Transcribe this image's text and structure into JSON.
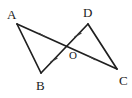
{
  "figure": {
    "background_color": "#ffffff",
    "line_color": "#1f1f1f",
    "tick_color": "#3a3a3a",
    "label_color": "#1a1a1a",
    "width": 132,
    "height": 98,
    "labels": {
      "a": "A",
      "b": "B",
      "c": "C",
      "d": "D",
      "o": "O"
    },
    "points": {
      "A": {
        "x": 17,
        "y": 24
      },
      "B": {
        "x": 41,
        "y": 73
      },
      "C": {
        "x": 117,
        "y": 69
      },
      "D": {
        "x": 88,
        "y": 24
      },
      "O": {
        "x": 67,
        "y": 48
      }
    },
    "label_positions": {
      "A": {
        "x": 7,
        "y": 19
      },
      "B": {
        "x": 36,
        "y": 90
      },
      "C": {
        "x": 119,
        "y": 85
      },
      "D": {
        "x": 83,
        "y": 17
      },
      "O": {
        "x": 69,
        "y": 59
      }
    },
    "segments": [
      {
        "name": "segment-AC",
        "from": "A",
        "to": "C"
      },
      {
        "name": "segment-DB",
        "from": "D",
        "to": "B"
      },
      {
        "name": "segment-AB",
        "from": "A",
        "to": "B"
      },
      {
        "name": "segment-DC",
        "from": "D",
        "to": "C"
      }
    ],
    "tick_marks": [
      {
        "name": "tick-AO",
        "on": "segment-AO",
        "x": 42,
        "y": 35,
        "angle": 118
      },
      {
        "name": "tick-OC",
        "on": "segment-OC",
        "x": 92,
        "y": 58,
        "angle": 118
      },
      {
        "name": "tick-DO",
        "on": "segment-DO",
        "x": 78,
        "y": 35,
        "angle": 62
      },
      {
        "name": "tick-OB",
        "on": "segment-OB",
        "x": 54,
        "y": 60,
        "angle": 62
      }
    ]
  }
}
